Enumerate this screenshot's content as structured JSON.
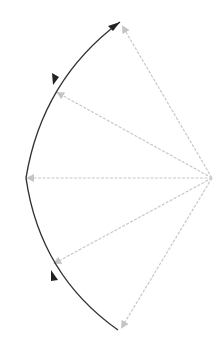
{
  "diagram": {
    "type": "vector-arc",
    "background": "#ffffff",
    "center": {
      "x": 212,
      "y": 178
    },
    "radius_approx": 190,
    "colors": {
      "arc": "#333333",
      "arc_arrow": "#222222",
      "ray": "#c8c8c8",
      "ray_arrow": "#bdbdbd"
    },
    "rays": [
      {
        "name": "ray-top",
        "to": {
          "x": 120,
          "y": 22
        }
      },
      {
        "name": "ray-upper",
        "to": {
          "x": 56,
          "y": 92
        }
      },
      {
        "name": "ray-middle",
        "to": {
          "x": 26,
          "y": 178
        }
      },
      {
        "name": "ray-lower",
        "to": {
          "x": 54,
          "y": 265
        }
      },
      {
        "name": "ray-bottom",
        "to": {
          "x": 120,
          "y": 330
        }
      }
    ],
    "arc_arrows": [
      {
        "name": "arc-arrow-top",
        "at": {
          "x": 118,
          "y": 22
        },
        "direction": "up-right"
      },
      {
        "name": "arc-arrow-upper",
        "at": {
          "x": 54,
          "y": 82
        },
        "direction": "down-left"
      },
      {
        "name": "arc-arrow-lower",
        "at": {
          "x": 54,
          "y": 275
        },
        "direction": "up-left"
      }
    ]
  }
}
